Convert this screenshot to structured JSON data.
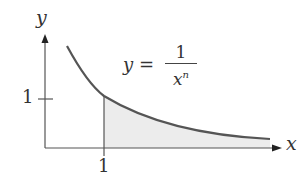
{
  "figure": {
    "y_axis_label": "y",
    "x_axis_label": "x",
    "x_tick_label": "1",
    "y_tick_label": "1",
    "equation": {
      "lhs": "y =",
      "numerator": "1",
      "denominator_base": "x",
      "denominator_exponent": "n"
    },
    "colors": {
      "curve": "#555555",
      "axis": "#555555",
      "shade": "#ececec"
    }
  }
}
